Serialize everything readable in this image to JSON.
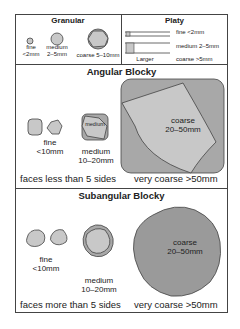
{
  "colors": {
    "outline": "#444444",
    "fill_light": "#c8c8c8",
    "fill_mid": "#a8a8a8",
    "fill_dark": "#9a9a9a",
    "background": "#ffffff"
  },
  "granular": {
    "title": "Granular",
    "items": [
      {
        "label": "fine",
        "size": "<2mm"
      },
      {
        "label": "medium",
        "size": "2–5mm"
      },
      {
        "label": "coarse 5–10mm",
        "size": ""
      }
    ]
  },
  "platy": {
    "title": "Platy",
    "larger_label": "Larger",
    "items": [
      {
        "label": "fine  <2mm"
      },
      {
        "label": "medium 2–5mm"
      },
      {
        "label": "coarse  >5mm"
      }
    ]
  },
  "angular_blocky": {
    "title": "Angular Blocky",
    "fine": {
      "label": "fine",
      "size": "<10mm"
    },
    "medium": {
      "inner": "medium",
      "label": "medium",
      "size": "10–20mm"
    },
    "coarse": {
      "label": "coarse",
      "size": "20–50mm"
    },
    "faces_note": "faces less than 5 sides",
    "very_coarse": "very coarse  >50mm"
  },
  "subangular_blocky": {
    "title": "Subangular Blocky",
    "fine": {
      "label": "fine",
      "size": "<10mm"
    },
    "medium": {
      "label": "medium",
      "size": "10–20mm"
    },
    "coarse": {
      "label": "coarse",
      "size": "20–50mm"
    },
    "faces_note": "faces more than 5 sides",
    "very_coarse": "very coarse  >50mm"
  }
}
